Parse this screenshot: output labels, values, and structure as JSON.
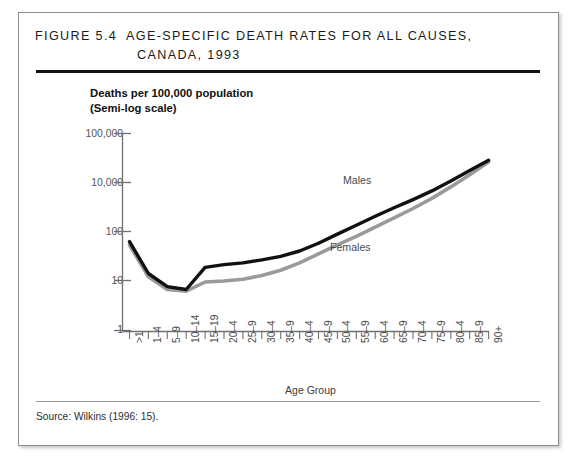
{
  "figure": {
    "title_line1": "Figure 5.4  Age-Specific Death Rates for All Causes,",
    "title_line2": "Canada, 1993",
    "source": "Source:  Wilkins (1996: 15)."
  },
  "chart_data": {
    "type": "line",
    "title": "Figure 5.4 Age-Specific Death Rates for All Causes, Canada, 1993",
    "subtitle": "",
    "xlabel": "Age Group",
    "ylabel": "Deaths per 100,000 population (Semi-log scale)",
    "ylabel_line1": "Deaths per 100,000 population",
    "ylabel_line2": "(Semi-log scale)",
    "yscale": "log",
    "ylim": [
      1,
      100000
    ],
    "ytick_labels": [
      "100,000",
      "10,000",
      "100",
      "10",
      "1"
    ],
    "grid": false,
    "legend_position": "inline-annotation",
    "categories": [
      ">1",
      "1–4",
      "5–9",
      "10–14",
      "15–19",
      "20–4",
      "25–9",
      "30–4",
      "35–9",
      "40–4",
      "45–9",
      "50–4",
      "55–9",
      "60–4",
      "65–9",
      "70–4",
      "75–9",
      "80–4",
      "85–9",
      "90+"
    ],
    "series": [
      {
        "name": "Males",
        "color": "#111111",
        "values": [
          180,
          28,
          13,
          11,
          40,
          47,
          52,
          62,
          76,
          104,
          163,
          280,
          470,
          790,
          1300,
          2100,
          3500,
          6200,
          11500,
          21000
        ]
      },
      {
        "name": "Females",
        "color": "#9a9a9a",
        "values": [
          148,
          23,
          11,
          10,
          17,
          18,
          20,
          25,
          34,
          52,
          88,
          150,
          245,
          420,
          720,
          1250,
          2250,
          4400,
          9000,
          19000
        ]
      }
    ],
    "annotations": [
      {
        "text": "Males",
        "x": "35–9"
      },
      {
        "text": "Females",
        "x": "45–9"
      }
    ]
  }
}
